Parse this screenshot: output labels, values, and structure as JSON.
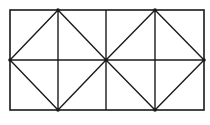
{
  "diagram": {
    "type": "geometric-figure",
    "stroke_color": "#1a1a1a",
    "background": "#ffffff",
    "rectangle": {
      "x": 10,
      "y": 10,
      "width": 194,
      "height": 100
    },
    "vertical_lines_x": [
      58,
      106,
      155
    ],
    "horizontal_lines_y": [
      60
    ],
    "diamonds": [
      {
        "points": [
          [
            58,
            10
          ],
          [
            106,
            60
          ],
          [
            58,
            110
          ],
          [
            10,
            60
          ]
        ]
      },
      {
        "points": [
          [
            155,
            10
          ],
          [
            204,
            60
          ],
          [
            155,
            110
          ],
          [
            106,
            60
          ]
        ]
      }
    ],
    "vertex_dots": [
      [
        58,
        10
      ],
      [
        155,
        10
      ],
      [
        10,
        60
      ],
      [
        106,
        60
      ],
      [
        204,
        60
      ],
      [
        58,
        110
      ],
      [
        155,
        110
      ]
    ]
  }
}
